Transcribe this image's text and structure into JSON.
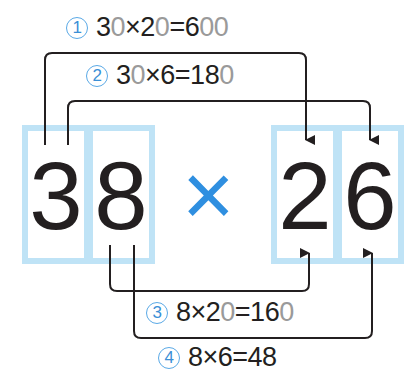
{
  "factor_a": {
    "tens": "3",
    "ones": "8"
  },
  "factor_b": {
    "tens": "2",
    "ones": "6"
  },
  "operator": "×",
  "colors": {
    "box": "#bfe3f6",
    "operator": "#2f8fe0",
    "circle": "#3a8fd6",
    "line": "#231f20",
    "placeholder_zero": "#9a9a9a"
  },
  "steps": [
    {
      "marker": "1",
      "parts": [
        {
          "t": "3"
        },
        {
          "t": "0",
          "gray": true
        },
        {
          "t": "×2"
        },
        {
          "t": "0",
          "gray": true
        },
        {
          "t": "=6"
        },
        {
          "t": "00",
          "gray": true
        }
      ]
    },
    {
      "marker": "2",
      "parts": [
        {
          "t": "3"
        },
        {
          "t": "0",
          "gray": true
        },
        {
          "t": "×6=18"
        },
        {
          "t": "0",
          "gray": true
        }
      ]
    },
    {
      "marker": "3",
      "parts": [
        {
          "t": "8×2"
        },
        {
          "t": "0",
          "gray": true
        },
        {
          "t": "=16"
        },
        {
          "t": "0",
          "gray": true
        }
      ]
    },
    {
      "marker": "4",
      "parts": [
        {
          "t": "8×6=48"
        }
      ]
    }
  ]
}
